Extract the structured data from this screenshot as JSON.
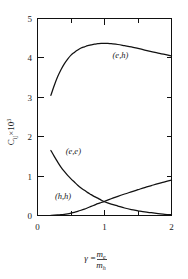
{
  "chart_data": {
    "type": "line",
    "title": "",
    "xlabel": "γ = m_e / m_h",
    "ylabel": "C_ij × 10³",
    "xlim": [
      0,
      2
    ],
    "ylim": [
      0,
      5
    ],
    "grid": false,
    "legend_position": "inline-annotations",
    "xticks": [
      0,
      1,
      2
    ],
    "xticklabels": [
      "0",
      "1",
      "2"
    ],
    "xminorticks": [
      0.5,
      1.5
    ],
    "yticks": [
      0,
      1,
      2,
      3,
      4,
      5
    ],
    "yticklabels": [
      "0",
      "1",
      "2",
      "3",
      "4",
      "5"
    ],
    "series": [
      {
        "name": "(e,h)",
        "label": "(e,h)",
        "color": "#111111",
        "x": [
          0.2,
          0.25,
          0.3,
          0.35,
          0.4,
          0.45,
          0.5,
          0.55,
          0.6,
          0.65,
          0.7,
          0.75,
          0.8,
          0.85,
          0.9,
          0.95,
          1.0,
          1.05,
          1.1,
          1.2,
          1.3,
          1.4,
          1.5,
          1.6,
          1.7,
          1.8,
          1.9,
          2.0
        ],
        "values": [
          3.05,
          3.3,
          3.52,
          3.7,
          3.85,
          3.97,
          4.07,
          4.14,
          4.2,
          4.25,
          4.28,
          4.31,
          4.33,
          4.35,
          4.36,
          4.37,
          4.37,
          4.37,
          4.36,
          4.34,
          4.31,
          4.28,
          4.24,
          4.2,
          4.16,
          4.12,
          4.09,
          4.05
        ]
      },
      {
        "name": "(e,e)",
        "label": "(e,e)",
        "color": "#111111",
        "x": [
          0.2,
          0.25,
          0.3,
          0.35,
          0.4,
          0.45,
          0.5,
          0.55,
          0.6,
          0.65,
          0.7,
          0.75,
          0.8,
          0.85,
          0.9,
          0.95,
          1.0,
          1.1,
          1.2,
          1.3,
          1.4,
          1.5,
          1.6,
          1.7,
          1.8,
          1.9,
          2.0
        ],
        "values": [
          1.65,
          1.5,
          1.36,
          1.23,
          1.12,
          1.02,
          0.93,
          0.85,
          0.77,
          0.7,
          0.64,
          0.58,
          0.53,
          0.48,
          0.44,
          0.39,
          0.35,
          0.29,
          0.24,
          0.19,
          0.15,
          0.12,
          0.09,
          0.07,
          0.05,
          0.03,
          0.02
        ]
      },
      {
        "name": "(h,h)",
        "label": "(h,h)",
        "color": "#111111",
        "x": [
          0.2,
          0.25,
          0.3,
          0.35,
          0.4,
          0.45,
          0.5,
          0.55,
          0.6,
          0.65,
          0.7,
          0.75,
          0.8,
          0.85,
          0.9,
          0.95,
          1.0,
          1.1,
          1.2,
          1.3,
          1.4,
          1.5,
          1.6,
          1.7,
          1.8,
          1.9,
          2.0
        ],
        "values": [
          0.005,
          0.008,
          0.013,
          0.02,
          0.03,
          0.043,
          0.06,
          0.08,
          0.105,
          0.133,
          0.163,
          0.196,
          0.23,
          0.265,
          0.3,
          0.33,
          0.36,
          0.425,
          0.487,
          0.545,
          0.6,
          0.655,
          0.71,
          0.76,
          0.81,
          0.855,
          0.9
        ]
      }
    ],
    "annotations": [
      {
        "text": "(e,h)",
        "x": 1.12,
        "y": 4.0
      },
      {
        "text": "(e,e)",
        "x": 0.42,
        "y": 1.55
      },
      {
        "text": "(h,h)",
        "x": 0.26,
        "y": 0.42
      }
    ]
  },
  "axis_label_parts": {
    "y_symbol": "C",
    "y_subscript": "ij",
    "y_times": "×10",
    "y_exponent": "3",
    "x_gamma": "γ",
    "x_equals": "=",
    "x_numerator_m": "m",
    "x_numerator_sub": "e",
    "x_denominator_m": "m",
    "x_denominator_sub": "h"
  }
}
